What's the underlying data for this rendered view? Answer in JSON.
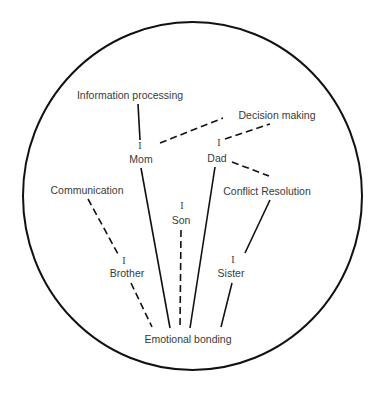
{
  "diagram": {
    "boundary": {
      "shape": "circle",
      "cx": 192.5,
      "cy": 196,
      "rx": 169.5,
      "ry": 174,
      "stroke": "#111111"
    },
    "members": {
      "mom": {
        "label": "Mom",
        "marker": "I"
      },
      "dad": {
        "label": "Dad",
        "marker": "I"
      },
      "son": {
        "label": "Son",
        "marker": "I"
      },
      "brother": {
        "label": "Brother",
        "marker": "I"
      },
      "sister": {
        "label": "Sister",
        "marker": "I"
      }
    },
    "functions": {
      "information_processing": "Information processing",
      "decision_making": "Decision making",
      "conflict_resolution": "Conflict Resolution",
      "communication": "Communication",
      "emotional_bonding": "Emotional bonding"
    },
    "connections": [
      {
        "from": "Information processing",
        "to": "Mom",
        "style": "solid"
      },
      {
        "from": "Mom",
        "to": "Decision making",
        "style": "dashed"
      },
      {
        "from": "Dad",
        "to": "Decision making",
        "style": "dashed"
      },
      {
        "from": "Dad",
        "to": "Conflict Resolution",
        "style": "dashed"
      },
      {
        "from": "Conflict Resolution",
        "to": "Sister",
        "style": "solid"
      },
      {
        "from": "Communication",
        "to": "Brother",
        "style": "dashed"
      },
      {
        "from": "Brother",
        "to": "Emotional bonding",
        "style": "dashed"
      },
      {
        "from": "Mom",
        "to": "Emotional bonding",
        "style": "solid"
      },
      {
        "from": "Son",
        "to": "Emotional bonding",
        "style": "dashed"
      },
      {
        "from": "Dad",
        "to": "Emotional bonding",
        "style": "solid"
      },
      {
        "from": "Sister",
        "to": "Emotional bonding",
        "style": "solid"
      }
    ]
  }
}
